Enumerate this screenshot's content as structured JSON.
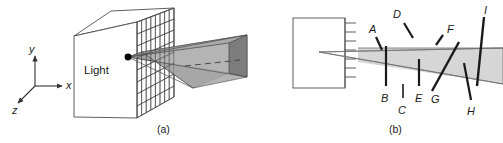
{
  "figure": {
    "panels": [
      {
        "id": "a",
        "caption": "(a)",
        "name": "panel-a-light-frustum",
        "light_label": "Light",
        "axes": {
          "x_label": "x",
          "y_label": "y",
          "z_label": "z"
        },
        "colors": {
          "outline": "#4d4d4d",
          "grid": "#3f3f3f",
          "beam_top": "#b3b3b3",
          "beam_side": "#8c8c8c",
          "beam_front": "#a6a6a6",
          "dot": "#000000"
        }
      },
      {
        "id": "b",
        "caption": "(b)",
        "name": "panel-b-labeled-segments",
        "tick_count": 7,
        "labels": [
          {
            "id": "A",
            "text": "A"
          },
          {
            "id": "B",
            "text": "B"
          },
          {
            "id": "C",
            "text": "C"
          },
          {
            "id": "D",
            "text": "D"
          },
          {
            "id": "E",
            "text": "E"
          },
          {
            "id": "F",
            "text": "F"
          },
          {
            "id": "G",
            "text": "G"
          },
          {
            "id": "H",
            "text": "H"
          },
          {
            "id": "I",
            "text": "I"
          }
        ],
        "colors": {
          "outline": "#4d4d4d",
          "band": "#d4d4d4",
          "segment": "#1a1a1a"
        }
      }
    ]
  }
}
